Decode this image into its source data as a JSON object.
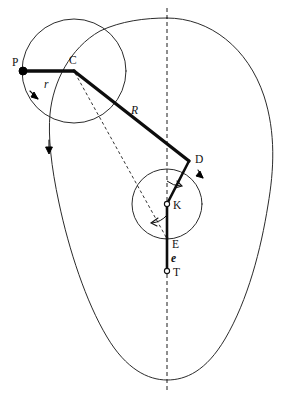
{
  "figure": {
    "type": "kinematic-linkage-diagram",
    "background_color": "#ffffff",
    "stroke_color": "#111111",
    "width": 288,
    "height": 400,
    "points": [
      {
        "id": "P",
        "label": "P",
        "x": 23,
        "y": 71,
        "marker": "filled-dot",
        "label_dx": -9,
        "label_dy": -6
      },
      {
        "id": "C",
        "label": "C",
        "x": 74,
        "y": 71,
        "marker": "none",
        "label_dx": -3,
        "label_dy": -6
      },
      {
        "id": "D",
        "label": "D",
        "x": 189,
        "y": 161,
        "marker": "none",
        "label_dx": 6,
        "label_dy": 1
      },
      {
        "id": "K",
        "label": "K",
        "x": 167,
        "y": 204,
        "marker": "open-circle",
        "label_dx": 5,
        "label_dy": 4
      },
      {
        "id": "E",
        "label": "E",
        "x": 167,
        "y": 238,
        "marker": "none",
        "label_dx": 5,
        "label_dy": 9
      },
      {
        "id": "T",
        "label": "T",
        "x": 167,
        "y": 271,
        "marker": "open-circle",
        "label_dx": 5,
        "label_dy": 4
      }
    ],
    "length_labels": [
      {
        "id": "r",
        "label": "r",
        "x": 47,
        "y": 84,
        "style": "italic"
      },
      {
        "id": "R",
        "label": "R",
        "x": 134,
        "y": 110,
        "style": "italic"
      },
      {
        "id": "e",
        "label": "e",
        "x": 172,
        "y": 258,
        "style": "italic-bold"
      }
    ],
    "links": [
      {
        "id": "crank-r",
        "from": "P",
        "to": "C",
        "weight": "bold"
      },
      {
        "id": "coupler-R",
        "from": "C",
        "to": "D",
        "weight": "bold"
      },
      {
        "id": "arm-KD",
        "from": "K",
        "to": "D",
        "weight": "bold-thin"
      },
      {
        "id": "slider-KE",
        "from": "K",
        "to": "E",
        "weight": "bold-thin"
      },
      {
        "id": "offset-ET",
        "from": "E",
        "to": "T",
        "weight": "bold-thin"
      }
    ],
    "construction_lines": [
      {
        "id": "dashed-C-E",
        "from": "C",
        "to": "E",
        "style": "dashed-fine"
      },
      {
        "id": "centerline-vertical",
        "x": 167,
        "y1": 8,
        "y2": 392,
        "style": "dashed"
      }
    ],
    "circles": [
      {
        "id": "crank-circle",
        "cx": 74,
        "cy": 71,
        "r": 52
      },
      {
        "id": "rocker-circle",
        "cx": 167,
        "cy": 204,
        "r": 35
      }
    ],
    "rotation_arrows": [
      {
        "id": "crank-rotation-arrow",
        "on": "crank-circle",
        "angle_deg": 200
      },
      {
        "id": "rocker-rotation-arrow",
        "on": "rocker-circle",
        "angle_deg": 40
      },
      {
        "id": "path-direction-arrow",
        "on": "outer-path",
        "x": 49,
        "y": 148
      }
    ],
    "angle_arcs": [
      {
        "id": "angle-at-K-upper",
        "vertex": "K",
        "between": [
          "centerline-vertical",
          "arm-KD"
        ]
      },
      {
        "id": "angle-at-E-lower",
        "vertex": "E",
        "between": [
          "dashed-C-E",
          "slider-KE"
        ]
      }
    ],
    "outer_path": {
      "id": "coupler-curve",
      "description": "egg-shaped closed coupler curve",
      "top_y": 18,
      "bottom_y": 380,
      "left_x": 50,
      "right_x": 272,
      "center_x": 167
    }
  }
}
